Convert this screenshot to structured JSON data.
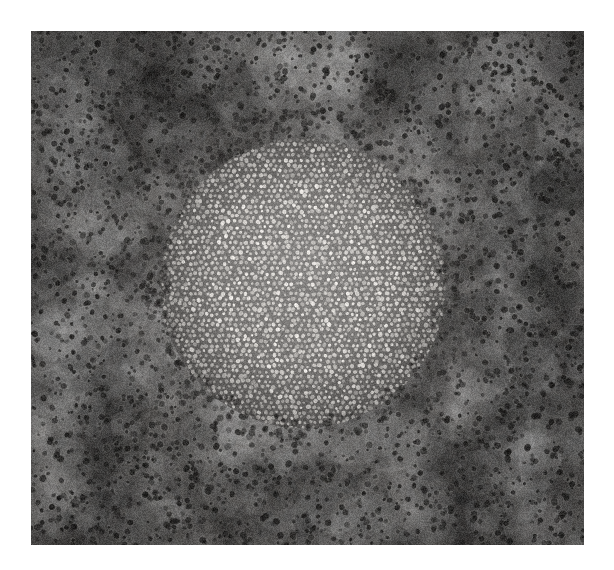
{
  "image": {
    "kind": "electron-micrograph",
    "title": "Grayscale micrograph of a circular pore-array domain",
    "caption": "",
    "background_color": "#ffffff",
    "frame": {
      "x": 31,
      "y": 31,
      "width": 553,
      "height": 514
    },
    "canvas": {
      "width": 614,
      "height": 570
    }
  },
  "scene": {
    "matrix": {
      "name": "outer-matrix",
      "description": "Dark granular field with small dark pores",
      "base_color": "#53514f",
      "pore_color": "#201f1e",
      "pore_density": 0.00115,
      "pore_radius_min": 1.1,
      "pore_radius_max": 3.2,
      "noise_amount": 30,
      "vignette_strength": 0.22
    },
    "halo": {
      "name": "transition-halo",
      "description": "Slightly brighter diffuse ring surrounding the bright domain",
      "color": "#6b6866",
      "inner_radius": 142,
      "outer_radius": 196,
      "opacity": 0.3
    },
    "domain": {
      "name": "bright-dot-domain",
      "description": "Circular region filled with a dense quasi-hexagonal array of bright dots",
      "center_x": 272,
      "center_y": 246,
      "radius_x": 141,
      "radius_y": 147,
      "edge_softness": 9,
      "background_color": "#6f6d6b",
      "dot_color": "#d8d5d1",
      "dot_color_bright": "#efece8",
      "lattice_spacing": 5.6,
      "lattice_jitter": 1.25,
      "dot_radius_min": 1.25,
      "dot_radius_max": 2.25,
      "row_offset": 0.5,
      "center_glow_opacity": 0.16
    },
    "grain": {
      "name": "film-grain",
      "amount": 26,
      "fine_amount": 14
    }
  },
  "chart_data": {
    "type": "heatmap",
    "xlabel": "",
    "ylabel": "",
    "regions": [
      {
        "label": "outer matrix",
        "mean_gray": 83,
        "texture": "dark granular pores"
      },
      {
        "label": "transition halo",
        "mean_gray": 103,
        "texture": "smoothed granular"
      },
      {
        "label": "bright dot domain background",
        "mean_gray": 111,
        "texture": "uniform"
      },
      {
        "label": "bright dots",
        "mean_gray": 216,
        "texture": "quasi-hexagonal array"
      }
    ],
    "grid": false,
    "legend": "none"
  }
}
